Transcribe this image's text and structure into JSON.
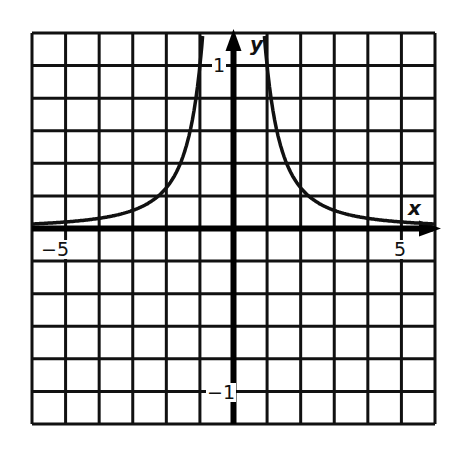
{
  "chart_data": {
    "type": "line",
    "title": "",
    "xlabel": "x",
    "ylabel": "y",
    "xlim": [
      -6,
      6
    ],
    "ylim": [
      -1.2,
      1.2
    ],
    "grid": true,
    "grid_x_step": 1,
    "grid_y_step": 0.2,
    "x_tick_labels": [
      {
        "value": -5,
        "label": "−5"
      },
      {
        "value": 5,
        "label": "5"
      }
    ],
    "y_tick_labels": [
      {
        "value": 1,
        "label": "1"
      },
      {
        "value": -1,
        "label": "−1"
      }
    ],
    "series": [
      {
        "name": "y = 1/x^2",
        "branches": [
          {
            "x": [
              -6,
              -5,
              -4,
              -3,
              -2,
              -1.5,
              -1.2,
              -1
            ],
            "y": [
              0.028,
              0.04,
              0.0625,
              0.111,
              0.25,
              0.444,
              0.694,
              1.0
            ]
          },
          {
            "x": [
              1,
              1.2,
              1.5,
              2,
              3,
              4,
              5,
              6
            ],
            "y": [
              1.0,
              0.694,
              0.444,
              0.25,
              0.111,
              0.0625,
              0.04,
              0.028
            ]
          }
        ]
      }
    ],
    "colors": {
      "line": "#111111",
      "grid": "#111111",
      "background": "#ffffff"
    }
  },
  "labels": {
    "x_axis": "x",
    "y_axis": "y",
    "x_neg5": "−5",
    "x_pos5": "5",
    "y_pos1": "1",
    "y_neg1": "−1"
  }
}
